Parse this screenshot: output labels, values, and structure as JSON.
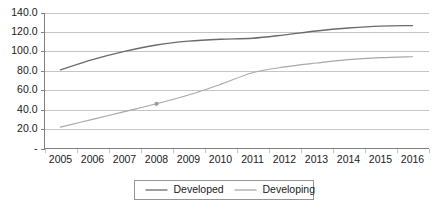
{
  "chart_data": {
    "type": "line",
    "title": "",
    "subtitle": "",
    "xlabel": "",
    "ylabel": "",
    "categories": [
      "2005",
      "2006",
      "2007",
      "2008",
      "2009",
      "2010",
      "2011",
      "2012",
      "2013",
      "2014",
      "2015",
      "2016"
    ],
    "x": [
      2005,
      2006,
      2007,
      2008,
      2009,
      2010,
      2011,
      2012,
      2013,
      2014,
      2015,
      2016
    ],
    "series": [
      {
        "name": "Developed",
        "color": "#6b6b6b",
        "values": [
          81.0,
          91.5,
          100.0,
          106.5,
          110.5,
          112.5,
          113.5,
          117.0,
          121.0,
          124.0,
          126.0,
          126.5
        ]
      },
      {
        "name": "Developing",
        "color": "#a8a8a8",
        "values": [
          22.0,
          30.0,
          38.0,
          46.0,
          55.0,
          66.0,
          78.0,
          84.0,
          88.0,
          91.5,
          93.5,
          94.5
        ]
      }
    ],
    "ylim": [
      0,
      140
    ],
    "ytick_values": [
      0,
      20,
      40,
      60,
      80,
      100,
      120,
      140
    ],
    "ytick_labels": [
      "-",
      "20.0",
      "40.0",
      "60.0",
      "80.0",
      "100.0",
      "120.0",
      "140.0"
    ],
    "grid": true,
    "grid_axis": "y",
    "legend_position": "bottom-center",
    "annotations": [
      {
        "name": "developing-2008-marker",
        "x": 2008,
        "y": 46.0
      }
    ]
  },
  "legend": {
    "entries": [
      {
        "label": "Developed"
      },
      {
        "label": "Developing"
      }
    ]
  },
  "colors": {
    "developed_line": "#6b6b6b",
    "developing_line": "#a8a8a8",
    "gridline": "#b7b7b7",
    "axis": "#808080",
    "text": "#1a1a1a",
    "background": "#ffffff"
  }
}
